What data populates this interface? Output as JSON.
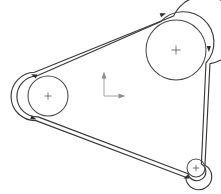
{
  "diagram": {
    "type": "engineering-line-drawing",
    "background_color": "#ffffff",
    "line_color": "#3a3a3a",
    "pulley_stroke_color": "#4a4a4a",
    "axis_color": "#9a9a9a",
    "arrow_color": "#2e2e2e",
    "pulleys": [
      {
        "name": "large-pulley",
        "label": "",
        "center_x": 176,
        "center_y": 50,
        "radius": 30,
        "center_mark": "+"
      },
      {
        "name": "medium-pulley",
        "label": "",
        "center_x": 48,
        "center_y": 96,
        "radius": 20,
        "center_mark": "+"
      },
      {
        "name": "small-pulley",
        "label": "",
        "center_x": 196,
        "center_y": 168,
        "radius": 9,
        "center_mark": "+"
      }
    ],
    "belt": {
      "name": "drive-belt",
      "offset": 4,
      "closed": true,
      "direction_arrows": [
        {
          "x": 163,
          "y": 14,
          "angle": -22
        },
        {
          "x": 209,
          "y": 48,
          "angle": 90
        },
        {
          "x": 188,
          "y": 180,
          "angle": 160
        },
        {
          "x": 33,
          "y": 73,
          "angle": 205
        },
        {
          "x": 33,
          "y": 119,
          "angle": 22
        }
      ]
    },
    "origin_marker": {
      "name": "coordinate-origin-marker",
      "x": 103,
      "y": 96,
      "x_axis_length": 18,
      "y_axis_length": 22,
      "x_label": "",
      "y_label": ""
    }
  }
}
